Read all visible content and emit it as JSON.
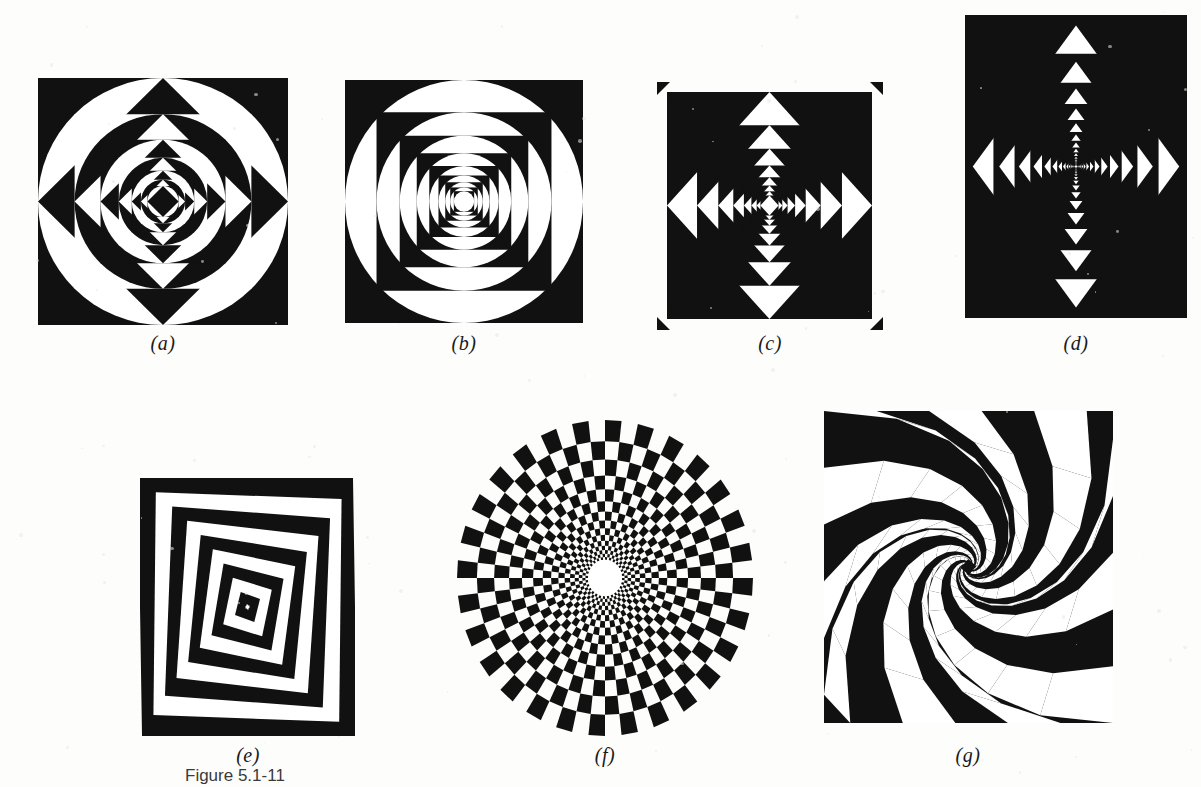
{
  "document": {
    "kind": "scanned-book-page",
    "caption": "Figure 5.1-11",
    "background_color": "#fdfdfc",
    "ink_color": "#111111",
    "paper_tone": "#f7f6f2"
  },
  "panels": [
    {
      "id": "a",
      "label": "(a)",
      "title": "nested square-circle-diamond recursion",
      "pattern": "square-circle-diamond",
      "x": 38,
      "y": 78,
      "width": 250,
      "height": 247,
      "label_x": 163,
      "label_y": 332,
      "levels": 7,
      "shrink": 0.685,
      "start_fill": "black",
      "corner_ticks": false
    },
    {
      "id": "b",
      "label": "(b)",
      "title": "nested square-circle alternation",
      "pattern": "square-circle",
      "x": 345,
      "y": 80,
      "width": 238,
      "height": 243,
      "label_x": 464,
      "label_y": 332,
      "levels": 9,
      "shrink": 0.735,
      "start_fill": "black",
      "corner_ticks": false
    },
    {
      "id": "c",
      "label": "(c)",
      "title": "nested square-diamond alternation with corner ticks",
      "pattern": "square-diamond",
      "x": 667,
      "y": 92,
      "width": 205,
      "height": 227,
      "label_x": 770,
      "label_y": 332,
      "levels": 8,
      "shrink": 0.7,
      "start_fill": "black",
      "corner_ticks": true
    },
    {
      "id": "d",
      "label": "(d)",
      "title": "rotating nested rectangles and diamonds",
      "pattern": "rotating-rect-diamond",
      "x": 965,
      "y": 15,
      "width": 222,
      "height": 303,
      "label_x": 1076,
      "label_y": 332,
      "levels": 16,
      "shrink": 0.855,
      "rotation_step": 0,
      "start_fill": "black",
      "corner_ticks": false
    },
    {
      "id": "e",
      "label": "(e)",
      "title": "concentric bands morphing from square to diamond",
      "pattern": "square-to-diamond-morph",
      "x": 140,
      "y": 478,
      "width": 215,
      "height": 258,
      "label_x": 248,
      "label_y": 744,
      "levels": 9,
      "shrink": 0.88,
      "start_fill": "black",
      "corner_ticks": false
    },
    {
      "id": "f",
      "label": "(f)",
      "title": "polar checkerboard disc with central hole",
      "pattern": "polar-checkerboard",
      "x": 457,
      "y": 420,
      "width": 296,
      "height": 316,
      "label_x": 605,
      "label_y": 744,
      "sectors": 56,
      "rings": 15,
      "ring_ratio": 1.175,
      "hole_radius": 17,
      "outer_radius": 148,
      "start_fill": "black",
      "corner_ticks": false
    },
    {
      "id": "g",
      "label": "(g)",
      "title": "twisted square spiral vortex",
      "pattern": "twist-spiral",
      "x": 824,
      "y": 411,
      "width": 289,
      "height": 312,
      "label_x": 968,
      "label_y": 744,
      "levels": 13,
      "shrink": 0.775,
      "rotation_step": 17,
      "spokes": 22,
      "start_fill": "black",
      "corner_ticks": false
    }
  ],
  "caption": {
    "text": "Figure 5.1-11",
    "x": 185,
    "y": 766
  }
}
